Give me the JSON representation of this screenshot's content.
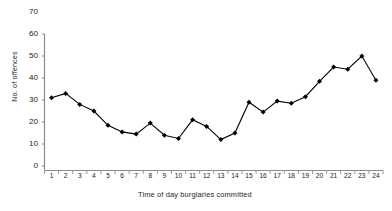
{
  "chart_data": {
    "type": "line",
    "title": "",
    "xlabel": "Time of day burglaries committed",
    "ylabel": "No. of offences",
    "categories": [
      "1",
      "2",
      "3",
      "4",
      "5",
      "6",
      "7",
      "8",
      "9",
      "10",
      "11",
      "12",
      "13",
      "14",
      "15",
      "16",
      "17",
      "18",
      "19",
      "20",
      "21",
      "22",
      "23",
      "24"
    ],
    "x": [
      1,
      2,
      3,
      4,
      5,
      6,
      7,
      8,
      9,
      10,
      11,
      12,
      13,
      14,
      15,
      16,
      17,
      18,
      19,
      20,
      21,
      22,
      23,
      24
    ],
    "values": [
      31,
      33,
      28,
      25,
      18.5,
      15.5,
      14.5,
      19.5,
      14,
      12.5,
      21,
      18,
      12,
      15,
      29,
      24.5,
      29.5,
      28.5,
      31.5,
      38.5,
      45,
      44,
      50,
      39
    ],
    "ylim": [
      0,
      70
    ],
    "ytick_labels": [
      "70",
      "60",
      "50",
      "40",
      "30",
      "20",
      "10",
      "0"
    ],
    "ytick_values": [
      70,
      60,
      50,
      40,
      30,
      20,
      10,
      0
    ],
    "grid": false,
    "legend": false,
    "legend_position": "none",
    "marker": "diamond",
    "line_color": "#000000",
    "marker_color": "#000000",
    "axis_color": "#808080",
    "background": "#ffffff"
  }
}
